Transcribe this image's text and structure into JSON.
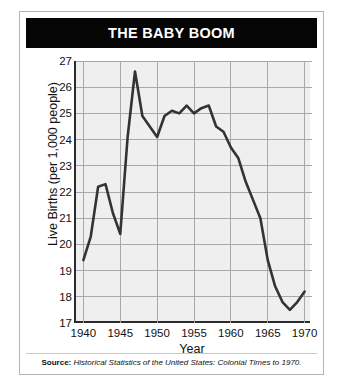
{
  "card": {
    "title": "THE BABY BOOM",
    "source_label": "Source:",
    "source_title": "Historical Statistics of the United States: Colonial Times to 1970."
  },
  "colors": {
    "title_bar": "#050505",
    "title_text": "#ffffff",
    "plot_background": "#efefef",
    "gridline": "#a8a8a8",
    "axis": "#2b2b2b",
    "series_line": "#333333",
    "card_border": "#b4b4b4"
  },
  "chart_data": {
    "type": "line",
    "title": "THE BABY BOOM",
    "xlabel": "Year",
    "ylabel": "Live Births (per 1,000 people)",
    "xlim": [
      1939,
      1971
    ],
    "ylim": [
      17,
      27
    ],
    "xticks": [
      1940,
      1945,
      1950,
      1955,
      1960,
      1965,
      1970
    ],
    "yticks": [
      17,
      18,
      19,
      20,
      21,
      22,
      23,
      24,
      25,
      26,
      27
    ],
    "grid": true,
    "legend": "none",
    "series": [
      {
        "name": "Live Births (per 1,000 people)",
        "x": [
          1940,
          1941,
          1942,
          1943,
          1944,
          1945,
          1946,
          1947,
          1948,
          1949,
          1950,
          1951,
          1952,
          1953,
          1954,
          1955,
          1956,
          1957,
          1958,
          1959,
          1960,
          1961,
          1962,
          1963,
          1964,
          1965,
          1966,
          1967,
          1968,
          1969,
          1970
        ],
        "values": [
          19.4,
          20.3,
          22.2,
          22.3,
          21.2,
          20.4,
          24.1,
          26.6,
          24.9,
          24.5,
          24.1,
          24.9,
          25.1,
          25.0,
          25.3,
          25.0,
          25.2,
          25.3,
          24.5,
          24.3,
          23.7,
          23.3,
          22.4,
          21.7,
          21.0,
          19.4,
          18.4,
          17.8,
          17.5,
          17.8,
          18.2
        ]
      }
    ]
  }
}
